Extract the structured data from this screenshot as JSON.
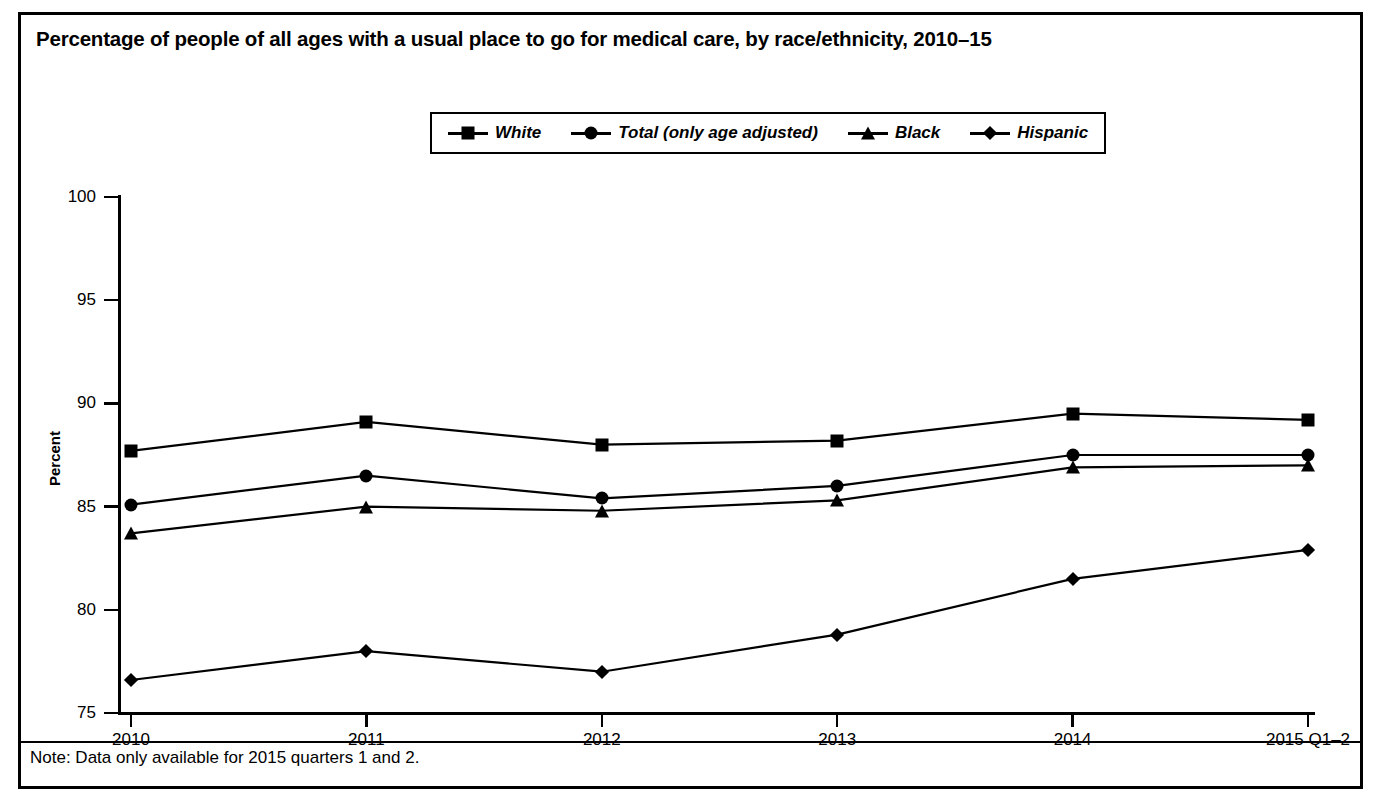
{
  "figure": {
    "title": "Percentage of people of all ages with a usual place to go for medical care, by race/ethnicity, 2010–15",
    "note": "Note: Data only available for 2015 quarters 1 and 2.",
    "border_color": "#000000",
    "background_color": "#ffffff"
  },
  "chart_data": {
    "type": "line",
    "title": "Percentage of people of all ages with a usual place to go for medical care, by race/ethnicity, 2010–15",
    "xlabel": "",
    "ylabel": "Percent",
    "categories": [
      "2010",
      "2011",
      "2012",
      "2013",
      "2014",
      "2015 Q1–2"
    ],
    "ylim": [
      75,
      100
    ],
    "yticks": [
      75,
      80,
      85,
      90,
      95,
      100
    ],
    "ytick_labels": [
      "75",
      "80",
      "85",
      "90",
      "95",
      "100"
    ],
    "grid": false,
    "legend_position": "top-center",
    "series": [
      {
        "name": "White",
        "marker": "square",
        "color": "#000000",
        "values": [
          87.7,
          89.1,
          88.0,
          88.2,
          89.5,
          89.2
        ]
      },
      {
        "name": "Total (only age adjusted)",
        "marker": "circle",
        "color": "#000000",
        "values": [
          85.1,
          86.5,
          85.4,
          86.0,
          87.5,
          87.5
        ]
      },
      {
        "name": "Black",
        "marker": "triangle",
        "color": "#000000",
        "values": [
          83.7,
          85.0,
          84.8,
          85.3,
          86.9,
          87.0
        ]
      },
      {
        "name": "Hispanic",
        "marker": "diamond",
        "color": "#000000",
        "values": [
          76.6,
          78.0,
          77.0,
          78.8,
          81.5,
          82.9
        ]
      }
    ]
  },
  "legend": {
    "items": [
      {
        "label": "White",
        "marker": "square"
      },
      {
        "label": "Total (only age adjusted)",
        "marker": "circle"
      },
      {
        "label": "Black",
        "marker": "triangle"
      },
      {
        "label": "Hispanic",
        "marker": "diamond"
      }
    ]
  }
}
